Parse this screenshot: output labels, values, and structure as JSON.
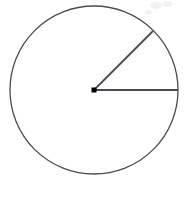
{
  "figure": {
    "canvas": {
      "width": 188,
      "height": 197,
      "background": "#ffffff"
    },
    "stroke_color": "#4a4a52",
    "center_dot_color": "#000000",
    "circle": {
      "label": "circle outline",
      "center_x": 94,
      "center_y": 90,
      "radius": 84,
      "stroke_width": 1.3
    },
    "center_point": {
      "label": "center point",
      "x": 94,
      "y": 90,
      "size": 5
    },
    "radius_horizontal": {
      "label": "horizontal radius",
      "x1": 94,
      "y1": 90,
      "x2": 178,
      "y2": 90,
      "angle_deg": 0,
      "stroke_width": 1.8
    },
    "radius_diagonal": {
      "label": "diagonal radius",
      "x1": 94,
      "y1": 90,
      "x2": 153,
      "y2": 31,
      "angle_deg": 45,
      "stroke_width": 1.8
    },
    "central_angle": {
      "label": "central angle between radii",
      "value_deg": 45
    },
    "artifacts": [
      {
        "label": "scan-smudge-1",
        "x": 150,
        "y": 2,
        "width": 12,
        "height": 7
      },
      {
        "label": "scan-smudge-2",
        "x": 163,
        "y": 1,
        "width": 9,
        "height": 6
      },
      {
        "label": "scan-smudge-3",
        "x": 145,
        "y": 10,
        "width": 7,
        "height": 5
      }
    ]
  }
}
